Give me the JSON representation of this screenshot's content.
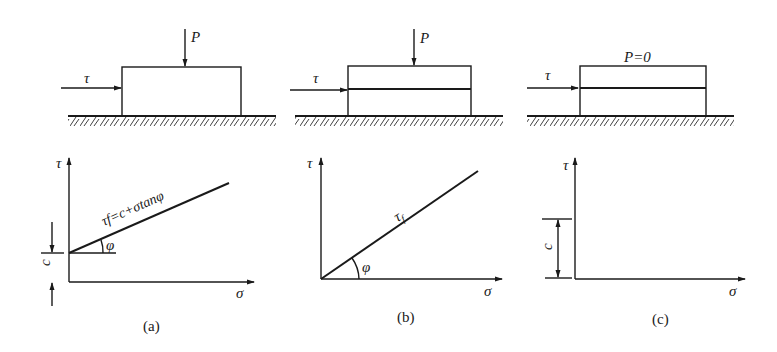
{
  "panels": [
    {
      "id": "a",
      "caption": "(a)",
      "load_label": "P",
      "shear_label": "τ",
      "specimen": "single-block",
      "plot": {
        "y_axis_label": "τ",
        "x_axis_label": "σ",
        "line_label": "τf=c+σtanφ",
        "line_label_sub": "f",
        "angle_label": "φ",
        "intercept_label": "c"
      }
    },
    {
      "id": "b",
      "caption": "(b)",
      "load_label": "P",
      "shear_label": "τ",
      "specimen": "split-block",
      "plot": {
        "y_axis_label": "τ",
        "x_axis_label": "σ",
        "line_label": "τf",
        "line_label_sub": "f",
        "angle_label": "φ"
      }
    },
    {
      "id": "c",
      "caption": "(c)",
      "load_label": "P=0",
      "shear_label": "τ",
      "specimen": "split-block",
      "plot": {
        "y_axis_label": "τ",
        "x_axis_label": "σ",
        "intercept_label": "c"
      }
    }
  ],
  "colors": {
    "ink": "#1a1a1a",
    "background": "#ffffff"
  }
}
